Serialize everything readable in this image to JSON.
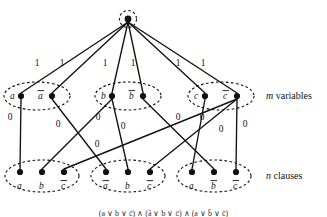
{
  "figure": {
    "source_node": {
      "name": "source",
      "x": 128,
      "y": 19
    },
    "variable_row_label": "m variables",
    "clause_row_label": "n clauses",
    "variable_capacity": "1",
    "clause_capacity": "0",
    "variable_groups": [
      {
        "name": "variable-a",
        "ellipse": {
          "cx": 37,
          "cy": 96,
          "rx": 33,
          "ry": 14
        },
        "nodes": [
          {
            "label": "a",
            "overline": false,
            "x": 21,
            "y": 96,
            "label_x": 10,
            "label_y": 99
          },
          {
            "label": "a",
            "overline": true,
            "x": 52,
            "y": 96,
            "label_x": 38,
            "label_y": 99
          }
        ]
      },
      {
        "name": "variable-b",
        "ellipse": {
          "cx": 128,
          "cy": 96,
          "rx": 33,
          "ry": 14
        },
        "nodes": [
          {
            "label": "b",
            "overline": false,
            "x": 112,
            "y": 96,
            "label_x": 101,
            "label_y": 99
          },
          {
            "label": "b",
            "overline": true,
            "x": 143,
            "y": 96,
            "label_x": 129,
            "label_y": 99
          }
        ]
      },
      {
        "name": "variable-c",
        "ellipse": {
          "cx": 221,
          "cy": 96,
          "rx": 33,
          "ry": 14
        },
        "nodes": [
          {
            "label": "c",
            "overline": false,
            "x": 205,
            "y": 96,
            "label_x": 194,
            "label_y": 99
          },
          {
            "label": "c",
            "overline": true,
            "x": 237,
            "y": 96,
            "label_x": 223,
            "label_y": 99
          }
        ]
      }
    ],
    "clause_groups": [
      {
        "name": "clause-1",
        "ellipse": {
          "cx": 42,
          "cy": 176,
          "rx": 37,
          "ry": 16
        },
        "nodes": [
          {
            "label": "a",
            "overline": false,
            "x": 20,
            "y": 172,
            "label_x": 17,
            "label_y": 189
          },
          {
            "label": "b",
            "overline": false,
            "x": 42,
            "y": 172,
            "label_x": 39,
            "label_y": 189
          },
          {
            "label": "c",
            "overline": true,
            "x": 64,
            "y": 172,
            "label_x": 61,
            "label_y": 189
          }
        ]
      },
      {
        "name": "clause-2",
        "ellipse": {
          "cx": 128,
          "cy": 176,
          "rx": 37,
          "ry": 16
        },
        "nodes": [
          {
            "label": "a",
            "overline": true,
            "x": 106,
            "y": 172,
            "label_x": 103,
            "label_y": 189
          },
          {
            "label": "b",
            "overline": false,
            "x": 128,
            "y": 172,
            "label_x": 125,
            "label_y": 189
          },
          {
            "label": "c",
            "overline": true,
            "x": 150,
            "y": 172,
            "label_x": 147,
            "label_y": 189
          }
        ]
      },
      {
        "name": "clause-3",
        "ellipse": {
          "cx": 214,
          "cy": 176,
          "rx": 37,
          "ry": 16
        },
        "nodes": [
          {
            "label": "a",
            "overline": false,
            "x": 192,
            "y": 172,
            "label_x": 189,
            "label_y": 189
          },
          {
            "label": "b",
            "overline": true,
            "x": 214,
            "y": 172,
            "label_x": 211,
            "label_y": 189
          },
          {
            "label": "c",
            "overline": true,
            "x": 236,
            "y": 172,
            "label_x": 233,
            "label_y": 189
          }
        ]
      }
    ],
    "source_edges": [
      {
        "name": "source-to-a",
        "x1": 128,
        "y1": 22,
        "x2": 21,
        "y2": 93,
        "cap": "1",
        "cap_x": 37,
        "cap_y": 66
      },
      {
        "name": "source-to-abar",
        "x1": 128,
        "y1": 22,
        "x2": 52,
        "y2": 93,
        "cap": "1",
        "cap_x": 62,
        "cap_y": 66
      },
      {
        "name": "source-to-b",
        "x1": 128,
        "y1": 22,
        "x2": 112,
        "y2": 93,
        "cap": "1",
        "cap_x": 105,
        "cap_y": 66
      },
      {
        "name": "source-to-bbar",
        "x1": 128,
        "y1": 22,
        "x2": 143,
        "y2": 93,
        "cap": "1",
        "cap_x": 133,
        "cap_y": 66
      },
      {
        "name": "source-to-c",
        "x1": 128,
        "y1": 22,
        "x2": 205,
        "y2": 93,
        "cap": "1",
        "cap_x": 178,
        "cap_y": 66
      },
      {
        "name": "source-to-cbar",
        "x1": 128,
        "y1": 22,
        "x2": 237,
        "y2": 93,
        "cap": "1",
        "cap_x": 203,
        "cap_y": 66
      }
    ],
    "literal_edges": [
      {
        "name": "a-to-clause1-a",
        "x1": 21,
        "y1": 99,
        "x2": 20,
        "y2": 169,
        "cap": "0",
        "cap_x": 10,
        "cap_y": 120
      },
      {
        "name": "abar-to-clause2-a",
        "x1": 52,
        "y1": 99,
        "x2": 106,
        "y2": 169,
        "cap": "0",
        "cap_x": 58,
        "cap_y": 127
      },
      {
        "name": "b-to-clause1-b",
        "x1": 112,
        "y1": 99,
        "x2": 42,
        "y2": 169,
        "cap": "0",
        "cap_x": 98,
        "cap_y": 120
      },
      {
        "name": "b-to-clause2-b",
        "x1": 112,
        "y1": 99,
        "x2": 128,
        "y2": 169,
        "cap": "0",
        "cap_x": 123,
        "cap_y": 129
      },
      {
        "name": "bbar-to-clause3-b",
        "x1": 143,
        "y1": 99,
        "x2": 214,
        "y2": 169,
        "cap": "0",
        "cap_x": 97,
        "cap_y": 147
      },
      {
        "name": "c-to-clause3-a",
        "x1": 205,
        "y1": 99,
        "x2": 192,
        "y2": 169,
        "cap": "0",
        "cap_x": 178,
        "cap_y": 120
      },
      {
        "name": "cbar-to-clause1-c",
        "x1": 237,
        "y1": 99,
        "x2": 64,
        "y2": 169,
        "cap": "0",
        "cap_x": 202,
        "cap_y": 120
      },
      {
        "name": "cbar-to-clause2-c",
        "x1": 237,
        "y1": 99,
        "x2": 150,
        "y2": 169,
        "cap": "0",
        "cap_x": 221,
        "cap_y": 132
      },
      {
        "name": "cbar-to-clause3-c",
        "x1": 237,
        "y1": 99,
        "x2": 236,
        "y2": 169,
        "cap": "0",
        "cap_x": 245,
        "cap_y": 127
      }
    ],
    "caption": "(a ∨ b ∨ c̄) ∧ (ā ∨ b ∨ c̄) ∧ (a ∨ b̄ ∨ c̄)"
  }
}
